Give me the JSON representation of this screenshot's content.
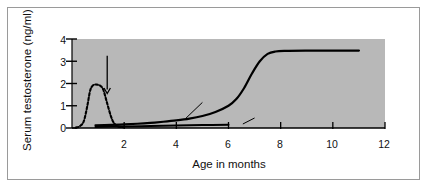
{
  "figure": {
    "background_color": "#ffffff",
    "plot_background_color": "#b8b8b8",
    "frame_color": "#9a9a9a",
    "line_color": "#000000"
  },
  "chart_data": {
    "type": "line",
    "title": "",
    "xlabel": "Age in months",
    "ylabel": "Serum testosterone (ng/ml)",
    "xlim": [
      0,
      12
    ],
    "ylim": [
      0,
      4
    ],
    "xticks": [
      2,
      4,
      6,
      8,
      10,
      12
    ],
    "yticks": [
      0,
      1,
      2,
      3,
      4
    ],
    "xtick_labels": [
      "2",
      "4",
      "6",
      "8",
      "10",
      "12"
    ],
    "ytick_labels": [
      "0",
      "1",
      "2",
      "3",
      "4"
    ],
    "grid": false,
    "legend": "inline-annotations",
    "series": [
      {
        "name": "Perinatal surge (dashed)",
        "style": "dashed",
        "color": "#000000",
        "x": [
          0.15,
          0.3,
          0.45,
          0.58,
          0.7,
          0.82,
          0.95,
          1.08,
          1.2,
          1.35,
          1.5,
          1.62,
          1.75,
          1.88,
          2.0
        ],
        "y": [
          0.02,
          0.08,
          0.3,
          0.95,
          1.7,
          1.93,
          1.95,
          1.9,
          1.72,
          1.1,
          0.5,
          0.2,
          0.08,
          0.04,
          0.05
        ]
      },
      {
        "name": "Male",
        "style": "solid",
        "color": "#000000",
        "x": [
          0.9,
          1.5,
          2.0,
          2.5,
          3.0,
          3.5,
          4.0,
          4.5,
          5.0,
          5.5,
          6.0,
          6.3,
          6.6,
          6.9,
          7.2,
          7.5,
          7.8,
          8.2,
          9.0,
          10.0,
          11.0
        ],
        "y": [
          0.12,
          0.14,
          0.16,
          0.19,
          0.23,
          0.28,
          0.34,
          0.42,
          0.54,
          0.72,
          1.0,
          1.3,
          1.8,
          2.45,
          3.0,
          3.33,
          3.44,
          3.47,
          3.48,
          3.48,
          3.48
        ]
      },
      {
        "name": "Female",
        "style": "solid",
        "color": "#000000",
        "x": [
          0.9,
          2.0,
          3.0,
          4.0,
          5.0,
          6.0
        ],
        "y": [
          0.05,
          0.07,
          0.09,
          0.11,
          0.13,
          0.15
        ]
      }
    ],
    "annotations": [
      {
        "text": "Birth",
        "type": "arrow-label",
        "label_x": 1.05,
        "label_y": 3.55,
        "arrow_from_x": 1.35,
        "arrow_from_y": 3.25,
        "arrow_to_x": 1.35,
        "arrow_to_y": 1.55
      },
      {
        "text": "Male",
        "type": "leader-label",
        "label_x": 5.0,
        "label_y": 1.35,
        "leader_from_x": 5.0,
        "leader_from_y": 1.15,
        "leader_to_x": 4.35,
        "leader_to_y": 0.42
      },
      {
        "text": "Female",
        "type": "leader-label",
        "label_x": 7.0,
        "label_y": 0.62,
        "leader_from_x": 7.0,
        "leader_from_y": 0.45,
        "leader_to_x": 6.55,
        "leader_to_y": 0.18
      }
    ]
  }
}
